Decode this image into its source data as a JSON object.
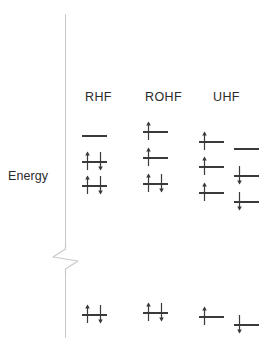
{
  "diagram": {
    "axis": {
      "label": "Energy",
      "break_icon": "axis-break-zigzag",
      "direction": "vertical-increasing-upward"
    },
    "colors": {
      "axis": "#c9c9c9",
      "level_bar": "#3a3a3a",
      "arrow": "#3a3a3a",
      "text": "#2b2b2b",
      "background": "#ffffff"
    },
    "columns": [
      {
        "id": "rhf",
        "label": "RHF",
        "label_x": 85,
        "subcolumns": [
          {
            "id": "rhf-spatial",
            "spin_set": "paired",
            "x": 82,
            "bar_width": 25,
            "levels": [
              {
                "id": "rhf-virtual-1",
                "y": 128,
                "occupancy": 0,
                "electrons": []
              },
              {
                "id": "rhf-occupied-2",
                "y": 154,
                "occupancy": 2,
                "electrons": [
                  "up",
                  "down"
                ]
              },
              {
                "id": "rhf-occupied-1",
                "y": 178,
                "occupancy": 2,
                "electrons": [
                  "up",
                  "down"
                ]
              },
              {
                "id": "rhf-core",
                "y": 307,
                "occupancy": 2,
                "electrons": [
                  "up",
                  "down"
                ]
              }
            ]
          }
        ]
      },
      {
        "id": "rohf",
        "label": "ROHF",
        "label_x": 145,
        "subcolumns": [
          {
            "id": "rohf-spatial",
            "spin_set": "restricted-open",
            "x": 143,
            "bar_width": 25,
            "levels": [
              {
                "id": "rohf-somo-2",
                "y": 124,
                "occupancy": 1,
                "electrons": [
                  "up"
                ]
              },
              {
                "id": "rohf-somo-1",
                "y": 150,
                "occupancy": 1,
                "electrons": [
                  "up"
                ]
              },
              {
                "id": "rohf-occupied-1",
                "y": 176,
                "occupancy": 2,
                "electrons": [
                  "up",
                  "down"
                ]
              },
              {
                "id": "rohf-core",
                "y": 305,
                "occupancy": 2,
                "electrons": [
                  "up",
                  "down"
                ]
              }
            ]
          }
        ]
      },
      {
        "id": "uhf",
        "label": "UHF",
        "label_x": 213,
        "subcolumns": [
          {
            "id": "uhf-alpha",
            "spin_set": "alpha",
            "x": 199,
            "bar_width": 25,
            "levels": [
              {
                "id": "uhf-alpha-3",
                "y": 134,
                "occupancy": 1,
                "electrons": [
                  "up"
                ]
              },
              {
                "id": "uhf-alpha-2",
                "y": 159,
                "occupancy": 1,
                "electrons": [
                  "up"
                ]
              },
              {
                "id": "uhf-alpha-1",
                "y": 185,
                "occupancy": 1,
                "electrons": [
                  "up"
                ]
              },
              {
                "id": "uhf-alpha-core",
                "y": 309,
                "occupancy": 1,
                "electrons": [
                  "up"
                ]
              }
            ]
          },
          {
            "id": "uhf-beta",
            "spin_set": "beta",
            "x": 234,
            "bar_width": 25,
            "levels": [
              {
                "id": "uhf-beta-3",
                "y": 141,
                "occupancy": 0,
                "electrons": []
              },
              {
                "id": "uhf-beta-2",
                "y": 168,
                "occupancy": 1,
                "electrons": [
                  "down"
                ]
              },
              {
                "id": "uhf-beta-1",
                "y": 194,
                "occupancy": 1,
                "electrons": [
                  "down"
                ]
              },
              {
                "id": "uhf-beta-core",
                "y": 317,
                "occupancy": 1,
                "electrons": [
                  "down"
                ]
              }
            ]
          }
        ]
      }
    ]
  }
}
